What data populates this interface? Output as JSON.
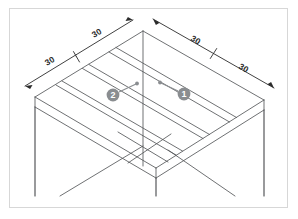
{
  "drawing": {
    "title": "Isometric grid slab with columns",
    "type": "isometric-technical-drawing",
    "background_color": "#ffffff",
    "frame_color": "#d7d7d7",
    "line_color": "#55575a",
    "dim_line_color": "#2b2b2b",
    "balloon_fill": "#8a8d90",
    "balloon_text_color": "#ffffff"
  },
  "dimensions": {
    "top_left_outer": "30",
    "top_left_inner": "30",
    "top_right_inner": "30",
    "top_right_outer": "30"
  },
  "balloons": {
    "left": "2",
    "right": "1"
  }
}
